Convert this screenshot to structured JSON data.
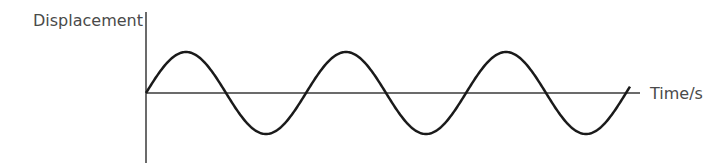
{
  "chart_data": {
    "type": "line",
    "title": "",
    "ylabel": "Displacement",
    "xlabel": "Time/s",
    "function": "sine",
    "cycles": 3,
    "amplitude": 1,
    "phase": 0,
    "ylim": [
      -1,
      1
    ],
    "grid": false,
    "legend": "none"
  },
  "colors": {
    "axis": "#3a3a3a",
    "curve": "#1a1a1a",
    "text": "#4a4a4a"
  }
}
